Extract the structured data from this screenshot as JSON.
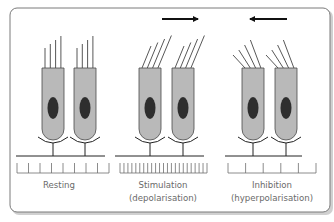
{
  "colors": {
    "frame_stroke": "#7a7a7a",
    "frame_shadow": "#d0d0d0",
    "cell_fill": "#b9b9b9",
    "cell_stroke": "#4a4a4a",
    "nucleus_fill": "#2e2e2e",
    "line": "#222222",
    "tick": "#6e6e6e",
    "label": "#6a6a6a"
  },
  "panels": [
    {
      "id": "resting",
      "label_lines": [
        "Resting"
      ],
      "hair_direction": "vertical",
      "arrow": null,
      "tick_count": 9
    },
    {
      "id": "stimulation",
      "label_lines": [
        "Stimulation",
        "(depolarisation)"
      ],
      "hair_direction": "right",
      "arrow": "right",
      "tick_count": 23
    },
    {
      "id": "inhibition",
      "label_lines": [
        "Inhibition",
        "(hyperpolarisation)"
      ],
      "hair_direction": "left",
      "arrow": "left",
      "tick_count": 6
    }
  ]
}
